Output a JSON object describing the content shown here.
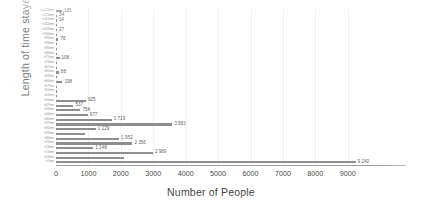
{
  "chart_data": {
    "type": "bar",
    "orientation": "horizontal",
    "title": "",
    "xlabel": "Number of People",
    "ylabel": "Length of time stayed",
    "xlim": [
      0,
      9500
    ],
    "ylim": null,
    "grid": false,
    "legend": null,
    "xticks": [
      "0",
      "1000",
      "2000",
      "3000",
      "4000",
      "5000",
      "6000",
      "7000",
      "8000",
      "9000"
    ],
    "xtick_values": [
      0,
      1000,
      2000,
      3000,
      4000,
      5000,
      6000,
      7000,
      8000,
      9000
    ],
    "categories": [
      ">=120mn",
      "<120mn",
      "<115mn",
      "<110mn",
      "<105mn",
      "<100mn",
      "<95mn",
      "<90mn",
      "<85mn",
      "<80mn",
      "<75mn",
      "<70mn",
      "<67mn",
      "<65mn",
      "<62mn",
      "<60mn",
      "<57mn",
      "<55mn",
      "<52mn",
      "<50mn",
      "<47mn",
      "<45mn",
      "<42mn",
      "<40mn",
      "<37mn",
      "<35mn",
      "<32mn",
      "<30mn",
      "<25mn",
      "<20mn",
      "<15mn",
      "<10mn",
      "<5mn"
    ],
    "values": [
      185,
      34,
      14,
      9,
      27,
      8,
      76,
      6,
      5,
      7,
      108,
      6,
      5,
      88,
      12,
      198,
      10,
      9,
      14,
      925,
      537,
      754,
      977,
      1719,
      3583,
      1229,
      890,
      1952,
      2356,
      1148,
      2989,
      2100,
      9240
    ],
    "value_labels": [
      "185",
      "34",
      "14",
      "",
      "27",
      "",
      "76",
      "",
      "",
      "",
      "108",
      "",
      "",
      "88",
      "",
      "198",
      "",
      "",
      "",
      "925",
      "537",
      "754",
      "977",
      "1 719",
      "3 583",
      "1 229",
      "",
      "1 952",
      "2 356",
      "1 148",
      "2 989",
      "",
      "9 240"
    ]
  },
  "style": {
    "bar_color": "#8e8e8e",
    "axis_color": "#9a9a9a",
    "text_color": "#4a4a4a",
    "background": "#ffffff"
  }
}
